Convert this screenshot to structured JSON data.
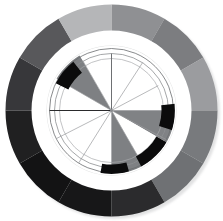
{
  "page": {
    "background": "#ffffff",
    "width": 223,
    "height": 221
  },
  "chart_data": {
    "type": "pie",
    "title": "",
    "subtitle": "",
    "xlabel": "",
    "ylabel": "",
    "legend_position": "none",
    "grid": true,
    "center": {
      "cx": 111.5,
      "cy": 110.5
    },
    "radii": {
      "outer_ring_outer": 106,
      "outer_ring_inner": 79,
      "white_gap_outer": 79,
      "white_gap_inner": 66,
      "inner_disc": 64,
      "hub": 3
    },
    "angle_offset_deg": -90,
    "outer_ring": {
      "name": "outer-ring-segments",
      "segment_count": 12,
      "categories": [
        "seg-01",
        "seg-02",
        "seg-03",
        "seg-04",
        "seg-05",
        "seg-06",
        "seg-07",
        "seg-08",
        "seg-09",
        "seg-10",
        "seg-11",
        "seg-12"
      ],
      "values": [
        30,
        30,
        30,
        30,
        30,
        30,
        30,
        30,
        30,
        30,
        30,
        30
      ],
      "start_angles": [
        0,
        30,
        60,
        90,
        120,
        150,
        180,
        210,
        240,
        270,
        300,
        330
      ],
      "end_angles": [
        30,
        60,
        90,
        120,
        150,
        180,
        210,
        240,
        270,
        300,
        330,
        360
      ],
      "colors": [
        "#8f9093",
        "#7c7d80",
        "#9b9c9f",
        "#787a7d",
        "#6f7174",
        "#2b2b2d",
        "#171718",
        "#131314",
        "#202021",
        "#37373a",
        "#58585b",
        "#b5b6b8"
      ]
    },
    "inner_disc": {
      "name": "inner-pie-wedges",
      "segment_count": 12,
      "categories": [
        "w-01",
        "w-02",
        "w-03",
        "w-04",
        "w-05",
        "w-06",
        "w-07",
        "w-08",
        "w-09",
        "w-10",
        "w-11",
        "w-12"
      ],
      "values": [
        30,
        30,
        30,
        30,
        30,
        30,
        30,
        30,
        30,
        30,
        30,
        30
      ],
      "start_angles": [
        0,
        30,
        60,
        90,
        120,
        150,
        180,
        210,
        240,
        270,
        300,
        330
      ],
      "end_angles": [
        30,
        60,
        90,
        120,
        150,
        180,
        210,
        240,
        270,
        300,
        330,
        360
      ],
      "colors": [
        "#ffffff",
        "#ffffff",
        "#ffffff",
        "#808285",
        "#ffffff",
        "#7e8083",
        "#ffffff",
        "#ffffff",
        "#ffffff",
        "#ffffff",
        "#7e8083",
        "#ffffff"
      ]
    },
    "highlight_arcs": [
      {
        "name": "arc-upper-left-black",
        "start_angle": 296,
        "end_angle": 322,
        "r_inner": 48,
        "r_outer": 62,
        "color": "#0b0b0c"
      },
      {
        "name": "arc-right-black",
        "start_angle": 84,
        "end_angle": 108,
        "r_inner": 50,
        "r_outer": 64,
        "color": "#0b0b0c"
      },
      {
        "name": "arc-lower-right-black",
        "start_angle": 120,
        "end_angle": 152,
        "r_inner": 52,
        "r_outer": 64,
        "color": "#0b0b0c"
      },
      {
        "name": "arc-bottom-black",
        "start_angle": 164,
        "end_angle": 190,
        "r_inner": 54,
        "r_outer": 64,
        "color": "#0b0b0c"
      }
    ],
    "radial_tick_lines": [
      {
        "name": "tick-north",
        "angle": 0,
        "r_inner": 0,
        "r_outer": 57,
        "color": "#6e7073",
        "width": 1.0
      },
      {
        "name": "tick-ne-1",
        "angle": 33,
        "r_inner": 0,
        "r_outer": 57,
        "color": "#9a9b9e",
        "width": 0.7
      },
      {
        "name": "tick-ne-2",
        "angle": 62,
        "r_inner": 0,
        "r_outer": 53,
        "color": "#9a9b9e",
        "width": 0.7
      },
      {
        "name": "tick-east",
        "angle": 90,
        "r_inner": 0,
        "r_outer": 62,
        "color": "#9a9b9e",
        "width": 0.7
      },
      {
        "name": "tick-se-1",
        "angle": 118,
        "r_inner": 0,
        "r_outer": 62,
        "color": "#9a9b9e",
        "width": 0.7
      },
      {
        "name": "tick-se-2",
        "angle": 150,
        "r_inner": 0,
        "r_outer": 62,
        "color": "#9a9b9e",
        "width": 0.7
      },
      {
        "name": "tick-south",
        "angle": 180,
        "r_inner": 0,
        "r_outer": 62,
        "color": "#9a9b9e",
        "width": 0.7
      },
      {
        "name": "tick-sw-1",
        "angle": 212,
        "r_inner": 0,
        "r_outer": 62,
        "color": "#9a9b9e",
        "width": 0.7
      },
      {
        "name": "tick-sw-2",
        "angle": 243,
        "r_inner": 0,
        "r_outer": 62,
        "color": "#9a9b9e",
        "width": 0.7
      },
      {
        "name": "tick-west",
        "angle": 270,
        "r_inner": 0,
        "r_outer": 62,
        "color": "#2a2a2c",
        "width": 1.0
      },
      {
        "name": "tick-nw-1",
        "angle": 300,
        "r_inner": 0,
        "r_outer": 58,
        "color": "#9a9b9e",
        "width": 0.7
      },
      {
        "name": "tick-nw-2",
        "angle": 330,
        "r_inner": 0,
        "r_outer": 58,
        "color": "#9a9b9e",
        "width": 0.7
      }
    ],
    "grid_arcs": [
      {
        "name": "grid-arc-outer",
        "radius": 62,
        "color": "#6a6c6f",
        "width": 0.8,
        "start_angle": 0,
        "end_angle": 360
      },
      {
        "name": "grid-arc-mid",
        "radius": 57,
        "color": "#8d8f92",
        "width": 0.8,
        "start_angle": 0,
        "end_angle": 360
      },
      {
        "name": "grid-arc-inner",
        "radius": 52,
        "color": "#a7a9ac",
        "width": 0.7,
        "start_angle": 0,
        "end_angle": 360
      }
    ],
    "notes": [
      "Grayscale 12-segment outer donut",
      "White separator annulus",
      "12-wedge inner pie with four gray wedges",
      "Thin radial tick spokes and three circular gridlines",
      "Four black arc highlights near inner rim"
    ]
  }
}
